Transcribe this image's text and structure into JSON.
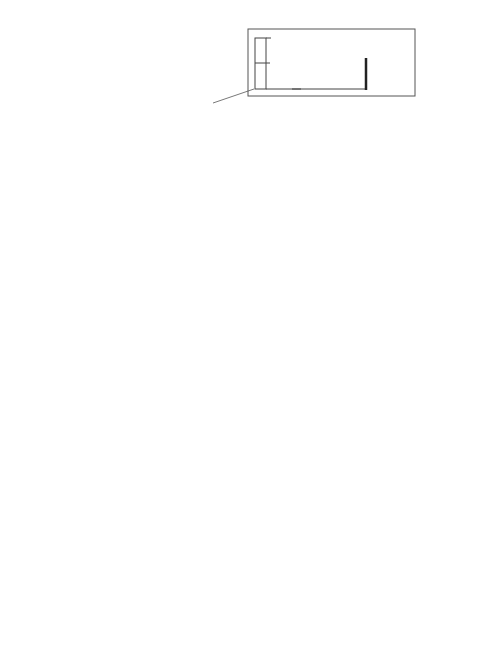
{
  "legend": {
    "ticks": [
      "20%",
      "10%",
      "0%"
    ],
    "label_lines": [
      "Anteil",
      "der",
      "Klassen"
    ],
    "median_label": "Median"
  },
  "histogram_axis": {
    "ticks": [
      "0",
      "200",
      "400",
      "600"
    ],
    "unit_label": "Zi"
  },
  "right_axis": {
    "left_ticks": [
      "0",
      "1",
      "2",
      "3",
      "4"
    ],
    "right_ticks": [
      "0",
      "1",
      "2",
      "3",
      "4"
    ],
    "percent": "%",
    "left_label": "Lintherratikum",
    "right_label": "Rheinerratikum"
  },
  "chart_data": [
    {
      "type": "bar",
      "title": "Zirkon-Histogramme (Anteil der Klassen, Klassenbreite 50)",
      "xlabel": "Zi",
      "ylabel": "Anteil der Klassen (%)",
      "ylim": [
        0,
        20
      ],
      "bin_width": 50,
      "series": [
        {
          "name": "Oberer Schotter, Dach (21)",
          "bins_start": 0,
          "values": [
            1.5,
            3.5,
            5.5,
            10.5,
            17,
            13.5,
            13.5,
            9.5,
            11.5,
            9,
            6.5,
            2.5,
            2.5,
            0,
            1
          ],
          "median": 300
        },
        {
          "name": "Oberer Schotter, Basis (20)",
          "bins_start": 0,
          "values": [
            0,
            2,
            8,
            10,
            8,
            8,
            10,
            11.5,
            11.5,
            10,
            8,
            7,
            4,
            2,
            0,
            0,
            0,
            0.8
          ],
          "median": 375
        },
        {
          "name": "Oberer Teil der Groblage (19)",
          "bins_start": 0,
          "values": [
            0,
            4.5,
            14,
            16,
            21,
            9,
            14,
            9,
            5,
            3,
            2,
            0,
            3
          ],
          "median": 225
        },
        {
          "name": "Unterer Teil der Groblage (18)",
          "bins_start": 0,
          "values": [
            0,
            4.5,
            19,
            20,
            21,
            20.5,
            8,
            8.5,
            2.5,
            2.5,
            2.5,
            4.5,
            0,
            0,
            1
          ],
          "median": 225
        },
        {
          "name": "Grundmoräne s.l. (17)",
          "bins_start": 0,
          "values": [
            5,
            25,
            21,
            15,
            7,
            8,
            5,
            3.5,
            0,
            8,
            1.5,
            1.5
          ],
          "median": 150
        },
        {
          "name": "Unterer Schotter, Dach (16)",
          "bins_start": 0,
          "values": [
            1,
            12.5,
            8.5,
            9.5,
            18.5,
            11,
            13.5,
            11,
            6,
            4,
            3,
            1.8,
            0.8
          ],
          "median": 250
        }
      ]
    },
    {
      "type": "line",
      "title": "Lintherratikum / Rheinerratikum",
      "xlabel": "%",
      "categories": [
        "21",
        "20",
        "19",
        "18",
        "17",
        "16"
      ],
      "series": [
        {
          "name": "Lintherratikum",
          "style": "dashed",
          "values": [
            1.8,
            0.9,
            1.1,
            1.8,
            3.8,
            4.1
          ]
        },
        {
          "name": "Rheinerratikum",
          "style": "solid",
          "values": [
            3.7,
            3.3,
            3.4,
            4.3,
            2.8,
            2.8
          ]
        }
      ],
      "xlim": [
        0,
        4
      ]
    }
  ]
}
